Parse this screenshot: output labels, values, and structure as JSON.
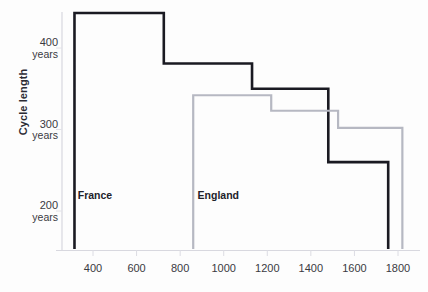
{
  "chart_data": {
    "type": "line",
    "title": "",
    "subtitle": "",
    "xlabel": "",
    "ylabel": "Cycle length",
    "xlim": [
      300,
      1850
    ],
    "ylim": [
      185,
      450
    ],
    "grid": false,
    "legend_position": "inline-annotation",
    "step_style": "post",
    "x_ticks": [
      400,
      600,
      800,
      1000,
      1200,
      1400,
      1600,
      1800
    ],
    "x_tick_labels": [
      "400",
      "600",
      "800",
      "1000",
      "1200",
      "1400",
      "1600",
      "1800"
    ],
    "y_ticks": [
      200,
      300,
      400
    ],
    "y_tick_labels": [
      "200 years",
      "300 years",
      "400 years"
    ],
    "y_tick_value_labels": [
      "200",
      "300",
      "400"
    ],
    "y_tick_unit_labels": [
      "years",
      "years",
      "years"
    ],
    "series": [
      {
        "name": "France",
        "color": "#1a1a22",
        "line_width": 2.6,
        "annotation": "France",
        "steps": [
          {
            "x_start": 315,
            "x_end": 725,
            "value": 443
          },
          {
            "x_start": 725,
            "x_end": 1130,
            "value": 381
          },
          {
            "x_start": 1130,
            "x_end": 1480,
            "value": 350
          },
          {
            "x_start": 1480,
            "x_end": 1755,
            "value": 260
          }
        ]
      },
      {
        "name": "England",
        "color": "#b6b8c2",
        "line_width": 2.2,
        "annotation": "England",
        "steps": [
          {
            "x_start": 860,
            "x_end": 1218,
            "value": 342
          },
          {
            "x_start": 1218,
            "x_end": 1525,
            "value": 323
          },
          {
            "x_start": 1525,
            "x_end": 1820,
            "value": 302
          }
        ]
      }
    ],
    "annotations": [
      {
        "text": "France",
        "x": 330,
        "y": 218
      },
      {
        "text": "England",
        "x": 880,
        "y": 218
      }
    ]
  },
  "axis": {
    "y_title": "Cycle length",
    "y_labels": [
      {
        "value": "400",
        "unit": "years"
      },
      {
        "value": "300",
        "unit": "years"
      },
      {
        "value": "200",
        "unit": "years"
      }
    ],
    "x_labels": [
      "400",
      "600",
      "800",
      "1000",
      "1200",
      "1400",
      "1600",
      "1800"
    ]
  },
  "series_labels": {
    "france": "France",
    "england": "England"
  },
  "colors": {
    "france_line": "#1a1a22",
    "england_line": "#b6b8c2",
    "axis": "#d5d5dc",
    "text": "#2b2b33",
    "background": "#fdfdfd"
  }
}
